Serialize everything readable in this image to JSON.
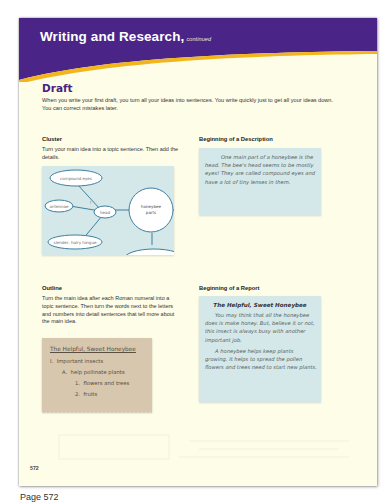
{
  "header": {
    "title": "Writing and Research,",
    "subtitle": "continued",
    "colors": {
      "band": "#4b2487",
      "accent": "#f2b51c",
      "page": "#fefde8"
    }
  },
  "draft": {
    "title": "Draft",
    "intro": "When you write your first draft, you turn all your ideas into sentences. You write quickly just to get all your ideas down. You can correct mistakes later."
  },
  "cluster": {
    "heading": "Cluster",
    "text": "Turn your main idea into a topic sentence. Then add the details.",
    "nodes": {
      "compound_eyes": "compound eyes",
      "antennae": "antennae",
      "head": "head",
      "tongue": "slender, hairy tongue",
      "center_line1": "honeybee",
      "center_line2": "parts"
    }
  },
  "description": {
    "heading": "Beginning of a Description",
    "text": "One main part of a honeybee is the head. The bee's head seems to be mostly eyes! They are called compound eyes and have a lot of tiny lenses in them."
  },
  "outline": {
    "heading": "Outline",
    "text": "Turn the main idea after each Roman numeral into a topic sentence. Then turn the words next to the letters and numbers into detail sentences that tell more about the main idea.",
    "card_title": "The Helpful, Sweet Honeybee",
    "items": [
      {
        "label": "I.",
        "text": "Important insects"
      },
      {
        "label": "A.",
        "text": "help pollinate plants"
      },
      {
        "label": "1.",
        "text": "flowers and trees"
      },
      {
        "label": "2.",
        "text": "fruits"
      }
    ]
  },
  "report": {
    "heading": "Beginning of a Report",
    "title": "The Helpful, Sweet Honeybee",
    "para1": "You may think that all the honeybee does is make honey. But, believe it or not, this insect is always busy with another important job.",
    "para2": "A honeybee helps keep plants growing. It helps to spread the pollen flowers and trees need to start new plants."
  },
  "footer": {
    "page_number": "572",
    "caption": "Page 572"
  }
}
